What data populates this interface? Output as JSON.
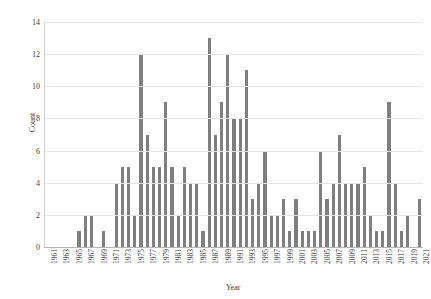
{
  "chart_data": {
    "type": "bar",
    "title": "",
    "xlabel": "Year",
    "ylabel": "Count",
    "ylim": [
      0,
      14
    ],
    "yticks": [
      0,
      2,
      4,
      6,
      8,
      10,
      12,
      14
    ],
    "grid": true,
    "legend": "none",
    "bar_color": "#7f7f7f",
    "categories": [
      "1961",
      "1962",
      "1963",
      "1964",
      "1965",
      "1966",
      "1967",
      "1968",
      "1969",
      "1970",
      "1971",
      "1972",
      "1973",
      "1974",
      "1975",
      "1976",
      "1977",
      "1978",
      "1979",
      "1980",
      "1981",
      "1982",
      "1983",
      "1984",
      "1985",
      "1986",
      "1987",
      "1988",
      "1989",
      "1990",
      "1991",
      "1992",
      "1993",
      "1994",
      "1995",
      "1996",
      "1997",
      "1998",
      "1999",
      "2000",
      "2001",
      "2002",
      "2003",
      "2004",
      "2005",
      "2006",
      "2007",
      "2008",
      "2009",
      "2010",
      "2011",
      "2012",
      "2013",
      "2014",
      "2015",
      "2016",
      "2017",
      "2018",
      "2019",
      "2020",
      "2021"
    ],
    "values": [
      0,
      0,
      0,
      0,
      0,
      1,
      2,
      2,
      0,
      1,
      0,
      4,
      5,
      5,
      2,
      12,
      7,
      5,
      5,
      9,
      5,
      2,
      5,
      4,
      4,
      1,
      13,
      7,
      9,
      12,
      8,
      8,
      11,
      3,
      4,
      6,
      2,
      2,
      3,
      1,
      3,
      1,
      1,
      1,
      6,
      3,
      4,
      7,
      4,
      4,
      4,
      5,
      2,
      1,
      1,
      9,
      4,
      1,
      2,
      0,
      3
    ],
    "xtick_labels": [
      "1961",
      "1963",
      "1965",
      "1967",
      "1969",
      "1971",
      "1973",
      "1975",
      "1977",
      "1979",
      "1981",
      "1983",
      "1985",
      "1987",
      "1989",
      "1991",
      "1993",
      "1995",
      "1997",
      "1999",
      "2001",
      "2003",
      "2005",
      "2007",
      "2009",
      "2011",
      "2013",
      "2015",
      "2017",
      "2019",
      "2021"
    ]
  }
}
